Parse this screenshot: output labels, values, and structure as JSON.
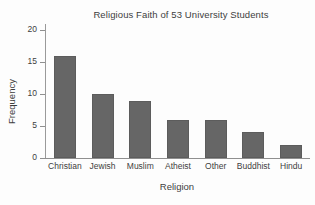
{
  "chart_data": {
    "type": "bar",
    "title": "Religious Faith of 53 University Students",
    "xlabel": "Religion",
    "ylabel": "Frequency",
    "categories": [
      "Christian",
      "Jewish",
      "Muslim",
      "Atheist",
      "Other",
      "Buddhist",
      "Hindu"
    ],
    "values": [
      16,
      10,
      9,
      6,
      6,
      4,
      2
    ],
    "ylim": [
      0,
      21
    ],
    "yticks": [
      0,
      5,
      10,
      15,
      20
    ],
    "ytick_labels": [
      "0",
      "5",
      "10",
      "15",
      "20"
    ],
    "grid": false,
    "legend": null,
    "total": 53,
    "colors": {
      "bar_fill": "#666666",
      "bar_edge": "#5c5c5c",
      "axis": "#8f8f8f",
      "text": "#3d3d3d",
      "background": "#fdfdfd"
    }
  }
}
